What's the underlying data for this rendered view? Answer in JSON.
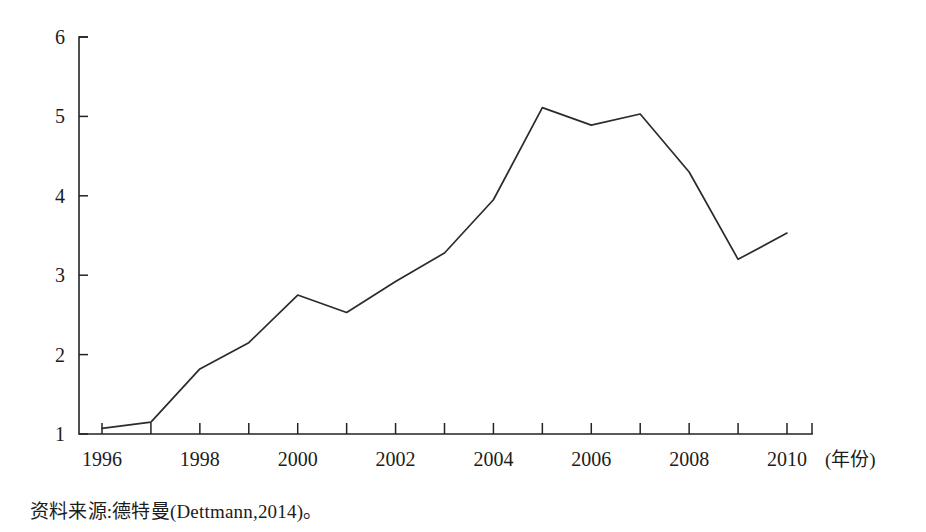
{
  "figure": {
    "source_caption": "资料来源:德特曼(Dettmann,2014)。",
    "axis_x_title": "(年份)",
    "line_color": "#2b2b2b",
    "axis_color": "#232323",
    "background_color": "#ffffff"
  },
  "chart_data": {
    "type": "line",
    "title": "",
    "subtitle": "",
    "xlabel": "(年份)",
    "ylabel": "",
    "x": [
      1996,
      1997,
      1998,
      1999,
      2000,
      2001,
      2002,
      2003,
      2004,
      2005,
      2006,
      2007,
      2008,
      2009,
      2010
    ],
    "values": [
      1.07,
      1.15,
      1.82,
      2.15,
      2.75,
      2.53,
      2.92,
      3.28,
      3.95,
      5.11,
      4.89,
      5.03,
      4.3,
      3.2,
      3.53
    ],
    "series": [
      {
        "name": "",
        "values": [
          1.07,
          1.15,
          1.82,
          2.15,
          2.75,
          2.53,
          2.92,
          3.28,
          3.95,
          5.11,
          4.89,
          5.03,
          4.3,
          3.2,
          3.53
        ]
      }
    ],
    "xlim": [
      1996,
      2010.5
    ],
    "ylim": [
      1,
      6
    ],
    "y_ticks": [
      1,
      2,
      3,
      4,
      5,
      6
    ],
    "y_tick_labels": [
      "1",
      "2",
      "3",
      "4",
      "5",
      "6"
    ],
    "x_ticks": [
      1996,
      1997,
      1998,
      1999,
      2000,
      2001,
      2002,
      2003,
      2004,
      2005,
      2006,
      2007,
      2008,
      2009,
      2010
    ],
    "x_tick_labels": [
      "1996",
      "",
      "1998",
      "",
      "2000",
      "",
      "2002",
      "",
      "2004",
      "",
      "2006",
      "",
      "2008",
      "",
      "2010"
    ],
    "x_major_labels": [
      "1996",
      "1998",
      "2000",
      "2002",
      "2004",
      "2006",
      "2008",
      "2010"
    ],
    "grid": false,
    "legend": false,
    "legend_position": "none",
    "annotations": []
  }
}
